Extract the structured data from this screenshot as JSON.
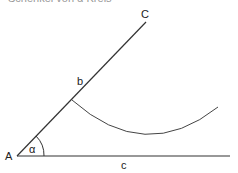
{
  "caption": "Schenkel von α Kreis",
  "labels": {
    "A": "A",
    "C": "C",
    "b": "b",
    "c": "c",
    "alpha": "α"
  },
  "colors": {
    "line": "#333333",
    "arc": "#444444"
  }
}
